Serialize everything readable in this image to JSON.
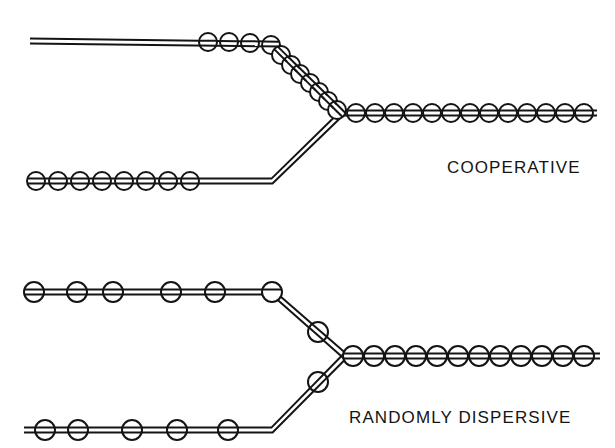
{
  "figure": {
    "title": "",
    "background_color": "#ffffff",
    "stroke_color": "#141414",
    "fill_color": "#ffffff",
    "width": 615,
    "height": 448
  },
  "labels": {
    "cooperative": "COOPERATIVE",
    "randomly_dispersive": "RANDOMLY DISPERSIVE"
  },
  "chart_data": {
    "type": "diagram",
    "title": "",
    "stroke_width": 2,
    "line_gap": 5,
    "panels": [
      {
        "name": "cooperative",
        "label": "COOPERATIVE",
        "label_x": 447,
        "label_y": 158,
        "fork_point": [
          342,
          113
        ],
        "branches": [
          {
            "name": "upper-arm",
            "points": [
              [
                30,
                41
              ],
              [
                272,
                44
              ],
              [
                342,
                113
              ]
            ],
            "circle_radius": 9,
            "circles": [
              [
                208,
                42
              ],
              [
                229,
                42
              ],
              [
                250,
                43
              ],
              [
                271,
                45
              ],
              [
                281,
                55
              ],
              [
                291,
                65
              ],
              [
                300,
                74
              ],
              [
                310,
                83
              ],
              [
                319,
                92
              ],
              [
                328,
                101
              ],
              [
                337,
                110
              ]
            ]
          },
          {
            "name": "lower-arm",
            "points": [
              [
                30,
                181
              ],
              [
                272,
                181
              ],
              [
                342,
                113
              ]
            ],
            "circle_radius": 9,
            "circles": [
              [
                36,
                181
              ],
              [
                58,
                181
              ],
              [
                80,
                181
              ],
              [
                102,
                181
              ],
              [
                124,
                181
              ],
              [
                146,
                181
              ],
              [
                168,
                181
              ],
              [
                190,
                181
              ]
            ]
          },
          {
            "name": "trunk",
            "points": [
              [
                342,
                113
              ],
              [
                597,
                113
              ]
            ],
            "circle_radius": 9,
            "circles": [
              [
                356,
                113
              ],
              [
                375,
                113
              ],
              [
                394,
                113
              ],
              [
                413,
                113
              ],
              [
                432,
                113
              ],
              [
                451,
                113
              ],
              [
                470,
                113
              ],
              [
                489,
                113
              ],
              [
                508,
                113
              ],
              [
                527,
                113
              ],
              [
                546,
                113
              ],
              [
                565,
                113
              ],
              [
                584,
                113
              ]
            ]
          }
        ]
      },
      {
        "name": "randomly-dispersive",
        "label": "RANDOMLY DISPERSIVE",
        "label_x": 349,
        "label_y": 408,
        "fork_point": [
          345,
          356
        ],
        "branches": [
          {
            "name": "upper-arm",
            "points": [
              [
                28,
                292
              ],
              [
                272,
                292
              ],
              [
                345,
                356
              ]
            ],
            "circle_radius": 10,
            "circles": [
              [
                34,
                292
              ],
              [
                77,
                292
              ],
              [
                113,
                292
              ],
              [
                171,
                292
              ],
              [
                215,
                292
              ],
              [
                272,
                292
              ],
              [
                318,
                332
              ]
            ]
          },
          {
            "name": "lower-arm",
            "points": [
              [
                24,
                430
              ],
              [
                272,
                430
              ],
              [
                345,
                356
              ]
            ],
            "circle_radius": 10,
            "circles": [
              [
                45,
                430
              ],
              [
                78,
                430
              ],
              [
                132,
                430
              ],
              [
                177,
                430
              ],
              [
                228,
                430
              ],
              [
                318,
                382
              ]
            ]
          },
          {
            "name": "trunk",
            "points": [
              [
                345,
                356
              ],
              [
                600,
                356
              ]
            ],
            "circle_radius": 10,
            "circles": [
              [
                353,
                356
              ],
              [
                374,
                356
              ],
              [
                395,
                356
              ],
              [
                416,
                356
              ],
              [
                437,
                356
              ],
              [
                458,
                356
              ],
              [
                479,
                356
              ],
              [
                500,
                356
              ],
              [
                521,
                356
              ],
              [
                542,
                356
              ],
              [
                563,
                356
              ],
              [
                584,
                356
              ]
            ]
          }
        ]
      }
    ]
  }
}
